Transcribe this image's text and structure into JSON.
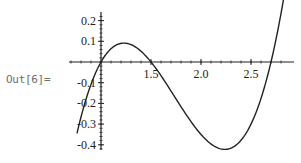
{
  "cell": {
    "output_label": "Out[6]="
  },
  "chart_data": {
    "type": "line",
    "title": "",
    "xlabel": "",
    "ylabel": "",
    "function": "(x-1)(x-1.5)(x-2.7)",
    "xlim": [
      0.76,
      2.83
    ],
    "ylim": [
      -0.42,
      0.25
    ],
    "axes_origin": [
      1.0,
      0.0
    ],
    "grid": false,
    "legend": null,
    "x_ticks": [
      {
        "value": 1.5,
        "label": "1.5"
      },
      {
        "value": 2.0,
        "label": "2.0"
      },
      {
        "value": 2.5,
        "label": "2.5"
      }
    ],
    "x_minor_step": 0.1,
    "y_ticks": [
      {
        "value": 0.2,
        "label": "0.2"
      },
      {
        "value": 0.1,
        "label": "0.1"
      },
      {
        "value": -0.1,
        "label": "-0.1"
      },
      {
        "value": -0.2,
        "label": "-0.2"
      },
      {
        "value": -0.3,
        "label": "-0.3"
      },
      {
        "value": -0.4,
        "label": "-0.4"
      }
    ],
    "y_minor_step": 0.02,
    "series": [
      {
        "name": "f(x)",
        "x": [
          0.76,
          0.8,
          0.9,
          1.0,
          1.1,
          1.2,
          1.22,
          1.3,
          1.4,
          1.5,
          1.6,
          1.7,
          1.8,
          1.9,
          2.0,
          2.1,
          2.2,
          2.3,
          2.4,
          2.5,
          2.6,
          2.7,
          2.8,
          2.83
        ],
        "y": [
          -0.343,
          -0.3,
          -0.216,
          0.0,
          0.064,
          0.084,
          0.091,
          0.056,
          0.026,
          0.0,
          -0.11,
          -0.2,
          -0.26,
          -0.32,
          -0.35,
          -0.39,
          -0.42,
          -0.4,
          -0.34,
          -0.2,
          -0.16,
          0.0,
          0.234,
          0.28
        ]
      }
    ],
    "style": {
      "line_color": "#222222",
      "axis_color": "#222222"
    }
  }
}
